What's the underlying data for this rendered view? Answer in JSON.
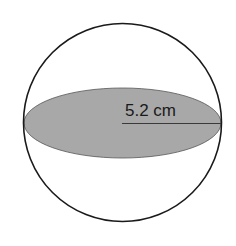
{
  "diagram": {
    "type": "sphere-cross-section",
    "radius_label": "5.2 cm",
    "colors": {
      "outline": "#1a1a1a",
      "cross_section_fill": "#a8a8a8",
      "background": "#ffffff"
    }
  }
}
